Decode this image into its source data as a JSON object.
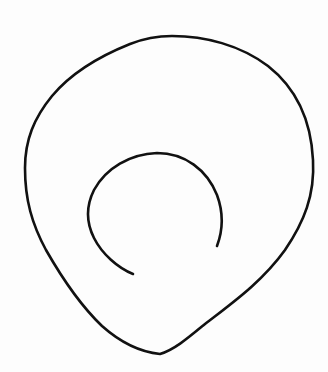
{
  "drawing": {
    "background": "#fdfdfd",
    "stroke_color": "#111111",
    "outer_stroke_width": 2.6,
    "inner_stroke_width": 2.6,
    "shapes": [
      {
        "name": "outer-closed-loop",
        "type": "closed-curve"
      },
      {
        "name": "inner-open-arc",
        "type": "open-curve"
      }
    ]
  }
}
